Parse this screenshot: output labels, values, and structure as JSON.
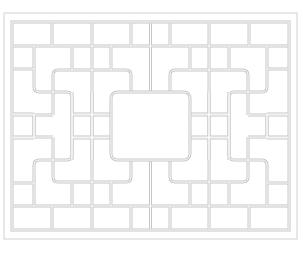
{
  "image": {
    "title": "Geometric lattice window pattern",
    "description": "Symmetric line-art lattice with rectangular panes and interlocking rounded L-shaped channels around a central rectangle"
  },
  "colors": {
    "background": "#ffffff",
    "line": "#c8c8c8",
    "channel_fill": "#ffffff",
    "frame": "#cfcfcf"
  },
  "frame": {
    "outer": {
      "x": 4,
      "y": 13,
      "w": 293,
      "h": 226
    },
    "inner": {
      "x": 13,
      "y": 23,
      "w": 275,
      "h": 206
    }
  },
  "center_panel": {
    "x": 111,
    "y": 92,
    "w": 80,
    "h": 70,
    "radius": 6
  }
}
